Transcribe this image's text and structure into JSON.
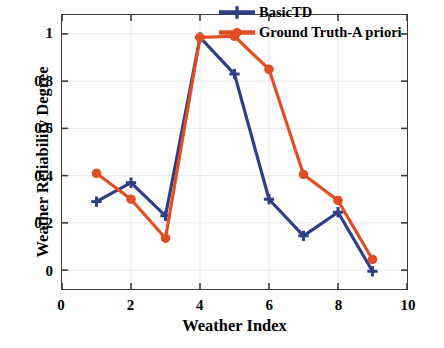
{
  "chart_data": {
    "type": "line",
    "title": "",
    "xlabel": "Weather Index",
    "ylabel": "Weather Reliability Degree",
    "x": [
      1,
      2,
      3,
      4,
      5,
      6,
      7,
      8,
      9
    ],
    "xlim": [
      0,
      10
    ],
    "ylim": [
      -0.08,
      1.08
    ],
    "xticks": [
      "0",
      "2",
      "4",
      "6",
      "8",
      "10"
    ],
    "xtick_values": [
      0,
      2,
      4,
      6,
      8,
      10
    ],
    "yticks": [
      "0",
      "0.2",
      "0.4",
      "0.6",
      "0.8",
      "1"
    ],
    "ytick_values": [
      0,
      0.2,
      0.4,
      0.6,
      0.8,
      1
    ],
    "grid": true,
    "legend_position": "top-right-inside",
    "series": [
      {
        "name": "BasicTD",
        "color": "#2E3F87",
        "marker": "plus",
        "values": [
          0.29,
          0.37,
          0.23,
          0.985,
          0.83,
          0.3,
          0.145,
          0.245,
          -0.005
        ]
      },
      {
        "name": "Ground Truth-A priori",
        "color": "#E04E22",
        "marker": "circle",
        "values": [
          0.41,
          0.3,
          0.135,
          0.985,
          0.99,
          0.85,
          0.405,
          0.295,
          0.045
        ]
      }
    ]
  },
  "axes": {
    "frame_color": "#3a3a3a",
    "grid_color": "#e8e8ea",
    "background": "#ffffff"
  }
}
